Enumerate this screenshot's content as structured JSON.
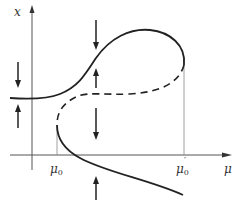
{
  "diagram": {
    "type": "bifurcation-diagram",
    "axes": {
      "y_label": "x",
      "x_label": "μ"
    },
    "ticks": [
      {
        "name": "mu0",
        "base": "μ",
        "sub": "0",
        "prime": ""
      },
      {
        "name": "mu0-prime",
        "base": "μ",
        "sub": "0",
        "prime": "′"
      }
    ],
    "branches": [
      {
        "name": "upper-stable-branch",
        "style": "solid"
      },
      {
        "name": "middle-unstable-branch",
        "style": "dashed"
      },
      {
        "name": "lower-stable-branch",
        "style": "solid"
      }
    ],
    "arrows": [
      {
        "name": "left-down-arrow",
        "direction": "down"
      },
      {
        "name": "left-up-arrow",
        "direction": "up"
      },
      {
        "name": "mid-top-down-arrow",
        "direction": "down"
      },
      {
        "name": "mid-up-arrow",
        "direction": "up"
      },
      {
        "name": "mid-lower-down-arrow",
        "direction": "down"
      },
      {
        "name": "bottom-up-arrow",
        "direction": "up"
      }
    ],
    "colors": {
      "stroke": "#222222",
      "axis": "#555555",
      "guide": "#888888"
    }
  }
}
